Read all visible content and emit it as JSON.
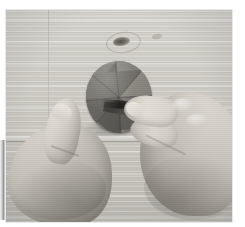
{
  "image": {
    "kind": "photograph",
    "rendering": "black-and-white",
    "caption": "Two hands creasing a sectored paper circle on a wooden tabletop",
    "width_px": 245,
    "height_px": 227
  },
  "canvas": {
    "background_color": "#ffffff",
    "margin_left_px": 6,
    "margin_top_px": 10
  },
  "photo": {
    "x_px": 6,
    "y_px": 10,
    "width_px": 226,
    "height_px": 212,
    "border_color": "#787878"
  },
  "scene": {
    "surface": {
      "name": "wooden table top",
      "base_color": "#d3d1ca",
      "shadow_color": "#bfbdb6",
      "grain_direction": "horizontal",
      "plank_seam_y_px": 131,
      "plank_edge_x_px": 42
    },
    "knot": {
      "name": "wood knot",
      "x_px": 107,
      "y_px": 27,
      "color": "#57544e"
    },
    "secondary_knot": {
      "name": "faint wood knot",
      "x_px": 146,
      "y_px": 24,
      "color": "#8c8982"
    },
    "disc": {
      "name": "paper circle with radial sectors",
      "x_px": 80,
      "y_px": 51,
      "width_px": 66,
      "height_px": 72,
      "rotation_deg": -4,
      "sector_count": 8,
      "sector_colors": [
        "#7d7a74",
        "#8e8b85",
        "#9a978f",
        "#86837d",
        "#6e6b66",
        "#63605b",
        "#6a6762",
        "#76736d"
      ],
      "fold_flap_color": "#403e3a",
      "state": "being folded along a crease"
    },
    "left_hand": {
      "name": "left hand holding disc",
      "x_px": -4,
      "y_px": 88,
      "skin_highlight": "#e2ded6",
      "skin_shadow": "#8e8a83",
      "pose": "thumb raised, pressing the circle flat"
    },
    "right_hand": {
      "name": "right hand creasing disc",
      "x_px": 118,
      "y_px": 74,
      "skin_highlight": "#e6e2da",
      "skin_shadow": "#9e9a92",
      "pose": "index finger extended toward the fold"
    }
  },
  "edge_strip": {
    "name": "page edge strip",
    "x_px": 0,
    "y_px": 140,
    "width_px": 5,
    "height_px": 80,
    "color": "#9a9a9a"
  }
}
